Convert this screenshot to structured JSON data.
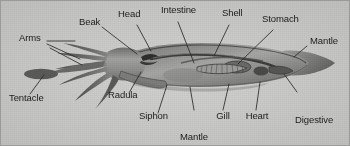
{
  "figure": {
    "style": "grayscale labelled biological illustration",
    "background_color": "#c9c9c7",
    "border_color": "#9a9a98",
    "label_color": "#1c1c1c",
    "leader_line_color": "#2b2b2b",
    "body_color": "#8f8f8d",
    "body_shadow_color": "#5e5e5c",
    "width": 350,
    "height": 146
  },
  "labels": [
    {
      "id": "arms",
      "text": "Arms",
      "lines": [
        "Arms"
      ],
      "x": 18,
      "y": 38,
      "align": "left"
    },
    {
      "id": "tentacle",
      "text": "Tentacle",
      "lines": [
        "Tentacle"
      ],
      "x": 8,
      "y": 98,
      "align": "left"
    },
    {
      "id": "beak",
      "text": "Beak",
      "lines": [
        "Beak"
      ],
      "x": 79,
      "y": 22,
      "align": "left"
    },
    {
      "id": "head",
      "text": "Head",
      "lines": [
        "Head"
      ],
      "x": 118,
      "y": 13,
      "align": "left"
    },
    {
      "id": "intestine",
      "text": "Intestine",
      "lines": [
        "Intestine"
      ],
      "x": 161,
      "y": 9,
      "align": "left"
    },
    {
      "id": "shell",
      "text": "Shell",
      "lines": [
        "Shell"
      ],
      "x": 222,
      "y": 12,
      "align": "left"
    },
    {
      "id": "stomach",
      "text": "Stomach",
      "lines": [
        "Stomach"
      ],
      "x": 262,
      "y": 17,
      "align": "left"
    },
    {
      "id": "mantle",
      "text": "Mantle",
      "lines": [
        "Mantle"
      ],
      "x": 309,
      "y": 40,
      "align": "left"
    },
    {
      "id": "radula",
      "text": "Radula",
      "lines": [
        "Radula"
      ],
      "x": 108,
      "y": 96,
      "align": "left"
    },
    {
      "id": "siphon",
      "text": "Siphon",
      "lines": [
        "Siphon"
      ],
      "x": 139,
      "y": 116,
      "align": "left"
    },
    {
      "id": "mantle-cavity",
      "text": "Mantle cavity",
      "lines": [
        "Mantle",
        "cavity"
      ],
      "x": 176,
      "y": 114,
      "align": "center"
    },
    {
      "id": "gill",
      "text": "Gill",
      "lines": [
        "Gill"
      ],
      "x": 222,
      "y": 114,
      "align": "center"
    },
    {
      "id": "heart",
      "text": "Heart",
      "lines": [
        "Heart"
      ],
      "x": 255,
      "y": 114,
      "align": "center"
    },
    {
      "id": "digestive-gland",
      "text": "Digestive gland",
      "lines": [
        "Digestive",
        "gland"
      ],
      "x": 295,
      "y": 96,
      "align": "left"
    }
  ],
  "leader_lines": [
    {
      "for": "arms",
      "points": "46,40 74,40"
    },
    {
      "for": "arms",
      "points": "46,44 78,58"
    },
    {
      "for": "arms",
      "points": "50,48 80,64"
    },
    {
      "for": "tentacle",
      "points": "30,94 43,74"
    },
    {
      "for": "beak",
      "points": "101,26 134,52"
    },
    {
      "for": "head",
      "points": "136,24 150,50"
    },
    {
      "for": "intestine",
      "points": "176,21 192,62"
    },
    {
      "for": "shell",
      "points": "228,24 214,55"
    },
    {
      "for": "stomach",
      "points": "272,29 236,64"
    },
    {
      "for": "mantle",
      "points": "306,45 293,56"
    },
    {
      "for": "radula",
      "points": "128,93 139,72"
    },
    {
      "for": "siphon",
      "points": "158,113 166,84"
    },
    {
      "for": "mantle-cavity",
      "points": "193,110 190,86"
    },
    {
      "for": "gill",
      "points": "222,110 228,84"
    },
    {
      "for": "heart",
      "points": "255,110 259,82"
    },
    {
      "for": "digestive-gland",
      "points": "296,92 284,74"
    }
  ],
  "anatomy_parts": [
    {
      "id": "mantle-body",
      "name": "mantle (body)"
    },
    {
      "id": "fin",
      "name": "caudal fin"
    },
    {
      "id": "arms-group",
      "name": "arms"
    },
    {
      "id": "tentacle-club",
      "name": "feeding tentacle with club"
    },
    {
      "id": "head-region",
      "name": "head"
    },
    {
      "id": "beak-part",
      "name": "beak"
    },
    {
      "id": "radula-part",
      "name": "radula"
    },
    {
      "id": "siphon-part",
      "name": "siphon / funnel"
    },
    {
      "id": "intestine-part",
      "name": "intestine"
    },
    {
      "id": "shell-part",
      "name": "pen / shell"
    },
    {
      "id": "stomach-part",
      "name": "stomach"
    },
    {
      "id": "gill-part",
      "name": "gill"
    },
    {
      "id": "heart-part",
      "name": "heart"
    },
    {
      "id": "digestive-part",
      "name": "digestive gland"
    },
    {
      "id": "mantle-cavity-part",
      "name": "mantle cavity"
    }
  ]
}
